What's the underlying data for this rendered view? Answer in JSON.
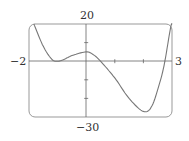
{
  "chart_data": {
    "type": "line",
    "title": "",
    "xlabel": "",
    "ylabel": "",
    "xlim": [
      -2,
      3
    ],
    "ylim": [
      -30,
      20
    ],
    "grid": false,
    "x_tick_marks": [
      1,
      2
    ],
    "y_tick_marks": [
      10,
      -10,
      -20
    ],
    "labels": {
      "x_min": "−2",
      "x_max": "3",
      "y_max": "20",
      "y_min": "−30"
    },
    "series": [
      {
        "name": "f(x)",
        "x": [
          -1.83,
          -1.5,
          -1.2,
          -1.0,
          -0.8,
          -0.5,
          0.0,
          0.25,
          0.5,
          1.0,
          1.5,
          2.0,
          2.3,
          2.6,
          2.75,
          2.95,
          3.0
        ],
        "y": [
          20,
          8,
          1,
          0,
          0.8,
          3,
          5,
          3.5,
          0,
          -9,
          -20,
          -27,
          -24,
          -10,
          0,
          18,
          20
        ]
      }
    ]
  },
  "colors": {
    "curve": "#777777",
    "frame": "#999999",
    "axis": "#666666"
  }
}
